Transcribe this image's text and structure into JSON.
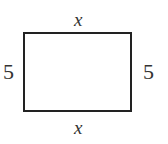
{
  "diagram": {
    "shape": "rectangle",
    "stroke_color": "#222222",
    "labels": {
      "top": "x",
      "bottom": "x",
      "left": "5",
      "right": "5"
    }
  }
}
